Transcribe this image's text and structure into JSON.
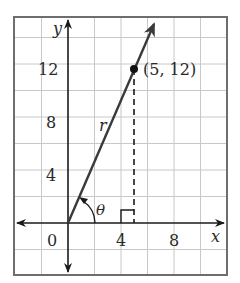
{
  "diagram": {
    "type": "coordinate-plane",
    "axes": {
      "x_label": "x",
      "y_label": "y",
      "origin_label": "0",
      "x_ticks": [
        "4",
        "8"
      ],
      "y_ticks": [
        "4",
        "8",
        "12"
      ],
      "grid_step": 2
    },
    "vector": {
      "label": "r",
      "from": [
        0,
        0
      ],
      "to_point": [
        5,
        12
      ],
      "point_label": "(5, 12)"
    },
    "angle": {
      "label": "θ"
    },
    "colors": {
      "grid": "#c8c8c8",
      "frame": "#6e6e6e",
      "axes": "#1a1a1a",
      "vector": "#3a3a3a",
      "text": "#2a2a2a"
    }
  }
}
